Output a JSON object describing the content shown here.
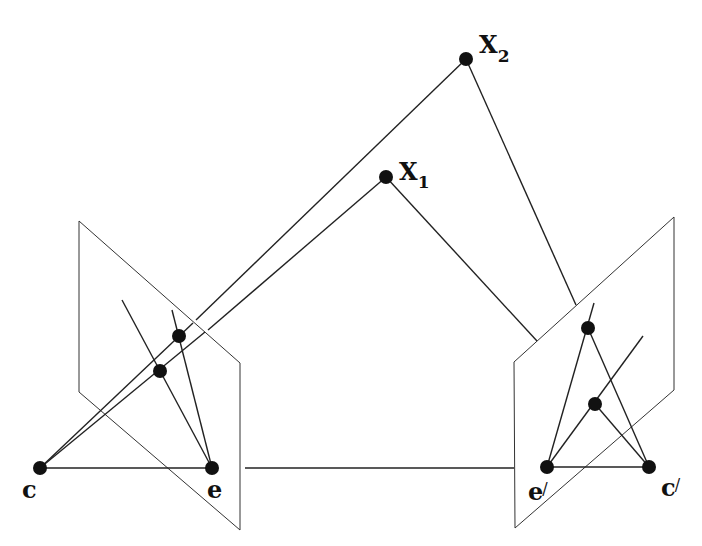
{
  "diagram": {
    "stroke_color": "#222222",
    "point_color": "#111111",
    "background": "#ffffff",
    "labels": {
      "X2": "X",
      "X2_sub": "2",
      "X1": "X",
      "X1_sub": "1",
      "c": "c",
      "e": "e",
      "e_prime": "e",
      "c_prime": "c",
      "prime": "/"
    },
    "points": {
      "X2": [
        466,
        59
      ],
      "X1": [
        386,
        177
      ],
      "c": [
        40,
        468
      ],
      "e": [
        212,
        468
      ],
      "e_prime": [
        547,
        467
      ],
      "c_prime": [
        649,
        467
      ],
      "x2_left": [
        179,
        336
      ],
      "x1_left": [
        160,
        371
      ],
      "x2_right": [
        588,
        328
      ],
      "x1_right": [
        595,
        404
      ]
    },
    "planes": {
      "left": [
        [
          79,
          221
        ],
        [
          240,
          363
        ],
        [
          240,
          530
        ],
        [
          79,
          392
        ]
      ],
      "right": [
        [
          514,
          362
        ],
        [
          674,
          217
        ],
        [
          674,
          390
        ],
        [
          515,
          528
        ]
      ]
    }
  }
}
